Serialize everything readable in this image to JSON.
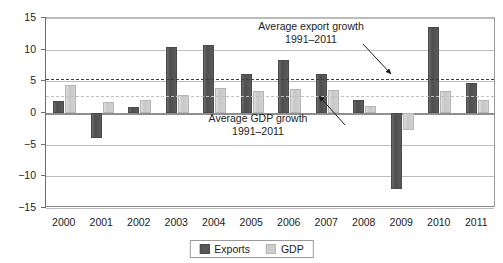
{
  "chart_data": {
    "type": "bar",
    "title": "",
    "subtitle": "",
    "xlabel": "",
    "ylabel": "",
    "ylim": [
      -15,
      15
    ],
    "yticks": [
      15,
      10,
      5,
      0,
      -5,
      -10,
      -15
    ],
    "ytick_labels": [
      "15",
      "10",
      "5",
      "0",
      "−5",
      "−10",
      "−15"
    ],
    "grid": true,
    "legend_position": "bottom-center",
    "categories": [
      "2000",
      "2001",
      "2002",
      "2003",
      "2004",
      "2005",
      "2006",
      "2007",
      "2008",
      "2009",
      "2010",
      "2011"
    ],
    "series": [
      {
        "name": "Exports",
        "color": "#575757",
        "values": [
          1.9,
          -3.9,
          1.0,
          10.4,
          10.8,
          6.2,
          8.3,
          6.2,
          2.1,
          -12.0,
          13.6,
          4.7
        ]
      },
      {
        "name": "GDP",
        "color": "#cdcdcd",
        "values": [
          4.4,
          1.7,
          2.1,
          2.8,
          3.9,
          3.4,
          3.8,
          3.6,
          1.1,
          -2.7,
          3.4,
          2.1
        ]
      }
    ],
    "reference_lines": [
      {
        "id": "avg-export-growth",
        "value": 5.4,
        "style": "dashed",
        "color": "#3b3b3b",
        "label_line1": "Average export growth",
        "label_line2": "1991–2011"
      },
      {
        "id": "avg-gdp-growth",
        "value": 2.7,
        "style": "dashed",
        "color": "#c0c0c0",
        "label_line1": "Average GDP growth",
        "label_line2": "1991–2011"
      }
    ],
    "annotations": [
      {
        "id": "export-annotation",
        "line1": "Average export growth",
        "line2": "1991–2011"
      },
      {
        "id": "gdp-annotation",
        "line1": "Average GDP growth",
        "line2": "1991–2011"
      }
    ]
  },
  "legend": {
    "items": [
      {
        "label": "Exports",
        "swatch": "exports-swatch"
      },
      {
        "label": "GDP",
        "swatch": "gdp-swatch"
      }
    ]
  }
}
